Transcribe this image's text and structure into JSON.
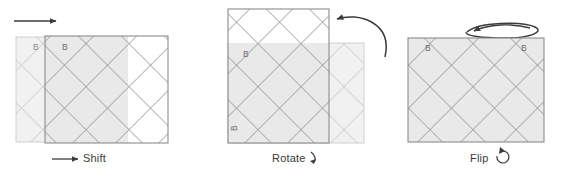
{
  "figure": {
    "title": "",
    "background_color": "#ffffff",
    "tile_fill": "#e9e9e9",
    "tile_fill_ghost": "#f1f1f1",
    "lattice_line_color": "#9a9a9a",
    "lattice_line_color_ghost": "#c9c9c9",
    "border_color": "#8c8c8c",
    "border_color_ghost": "#c4c4c4",
    "arrow_color": "#3c3c3c",
    "label_color": "#3a3a3a"
  },
  "panels": [
    {
      "id": "shift",
      "caption": "Shift",
      "arrow": "straight-right-arrow",
      "corner_labels": [
        "B",
        "B"
      ]
    },
    {
      "id": "rotate",
      "caption": "Rotate",
      "arrow": "curved-rotate-arrow",
      "caption_glyph": "rotate-hook-glyph",
      "corner_labels": [
        "B",
        "B"
      ]
    },
    {
      "id": "flip",
      "caption": "Flip",
      "arrow": "ellipse-flip-arrow",
      "caption_glyph": "flip-loop-glyph",
      "corner_labels": [
        "B",
        "B"
      ]
    }
  ],
  "captions": {
    "shift": "Shift",
    "rotate": "Rotate",
    "flip": "Flip"
  },
  "corner_label": "B"
}
